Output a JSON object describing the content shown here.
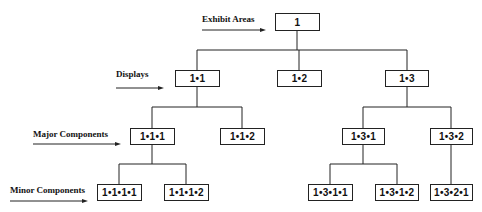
{
  "diagram": {
    "type": "hierarchy-tree",
    "line_color": "#222222",
    "levels": [
      {
        "id": "exhibit",
        "label": "Exhibit Areas"
      },
      {
        "id": "displays",
        "label": "Displays"
      },
      {
        "id": "major",
        "label": "Major Components"
      },
      {
        "id": "minor",
        "label": "Minor Components"
      }
    ],
    "nodes": {
      "n1": "1",
      "n1_1": "1•1",
      "n1_2": "1•2",
      "n1_3": "1•3",
      "n1_1_1": "1•1•1",
      "n1_1_2": "1•1•2",
      "n1_3_1": "1•3•1",
      "n1_3_2": "1•3•2",
      "n1_1_1_1": "1•1•1•1",
      "n1_1_1_2": "1•1•1•2",
      "n1_3_1_1": "1•3•1•1",
      "n1_3_1_2": "1•3•1•2",
      "n1_3_2_1": "1•3•2•1"
    },
    "edges": [
      [
        "1",
        "1•1"
      ],
      [
        "1",
        "1•2"
      ],
      [
        "1",
        "1•3"
      ],
      [
        "1•1",
        "1•1•1"
      ],
      [
        "1•1",
        "1•1•2"
      ],
      [
        "1•3",
        "1•3•1"
      ],
      [
        "1•3",
        "1•3•2"
      ],
      [
        "1•1•1",
        "1•1•1•1"
      ],
      [
        "1•1•1",
        "1•1•1•2"
      ],
      [
        "1•3•1",
        "1•3•1•1"
      ],
      [
        "1•3•1",
        "1•3•1•2"
      ],
      [
        "1•3•2",
        "1•3•2•1"
      ]
    ]
  }
}
